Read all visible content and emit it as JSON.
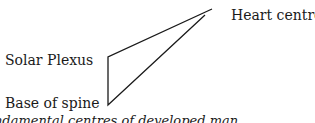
{
  "diagram": {
    "labels": {
      "heart": "Heart centre",
      "solar": "Solar Plexus",
      "base": "Base of spine"
    },
    "caption": "ndamental centres of developed man",
    "line_color": "#1a1a1a"
  }
}
